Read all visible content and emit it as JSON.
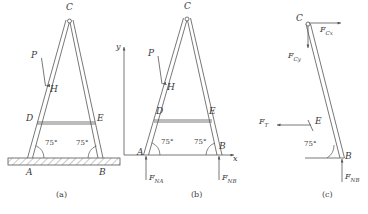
{
  "figure": {
    "stroke_color": "#555555",
    "text_color": "#3a3a3a",
    "ground_fill": "#e9e9e9"
  },
  "panels": [
    {
      "id": "a",
      "caption": "(a)",
      "points": [
        "C",
        "P",
        "H",
        "D",
        "E",
        "A",
        "B"
      ],
      "angles": [
        "75°",
        "75°"
      ],
      "has_ground": true,
      "forces": []
    },
    {
      "id": "b",
      "caption": "(b)",
      "points": [
        "C",
        "P",
        "H",
        "D",
        "E",
        "A",
        "B"
      ],
      "angles": [
        "75°",
        "75°"
      ],
      "axes": [
        "y",
        "x"
      ],
      "has_ground": false,
      "forces": [
        "F_NA",
        "F_NB"
      ]
    },
    {
      "id": "c",
      "caption": "(c)",
      "points": [
        "C",
        "E",
        "B"
      ],
      "angles": [
        "75°"
      ],
      "has_ground": false,
      "forces": [
        "F_Cx",
        "F_Cy",
        "F_T",
        "F_NB"
      ]
    }
  ],
  "labels": {
    "a": {
      "C": "C",
      "P": "P",
      "H": "H",
      "D": "D",
      "E": "E",
      "A": "A",
      "B": "B",
      "angle_left": "75°",
      "angle_right": "75°",
      "caption": "(a)"
    },
    "b": {
      "C": "C",
      "P": "P",
      "H": "H",
      "D": "D",
      "E": "E",
      "A": "A",
      "B": "B",
      "angle_left": "75°",
      "angle_right": "75°",
      "axis_y": "y",
      "axis_x": "x",
      "F_NA": "F",
      "F_NA_sub": "NA",
      "F_NB": "F",
      "F_NB_sub": "NB",
      "caption": "(b)"
    },
    "c": {
      "C": "C",
      "E": "E",
      "B": "B",
      "angle": "75°",
      "F_Cx": "F",
      "F_Cx_sub": "Cx",
      "F_Cy": "F",
      "F_Cy_sub": "Cy",
      "F_T": "F",
      "F_T_sub": "T",
      "F_NB": "F",
      "F_NB_sub": "NB",
      "caption": "(c)"
    }
  }
}
